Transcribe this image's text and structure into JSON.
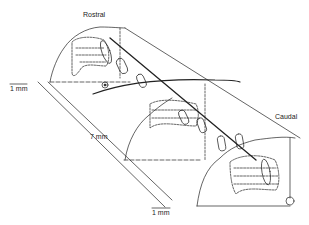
{
  "diagram": {
    "labels": {
      "rostral": "Rostral",
      "caudal": "Caudal",
      "scale_left": "1 mm",
      "scale_length": "7 mm",
      "scale_bottom": "1 mm"
    },
    "colors": {
      "line": "#222222",
      "background": "#ffffff"
    }
  }
}
